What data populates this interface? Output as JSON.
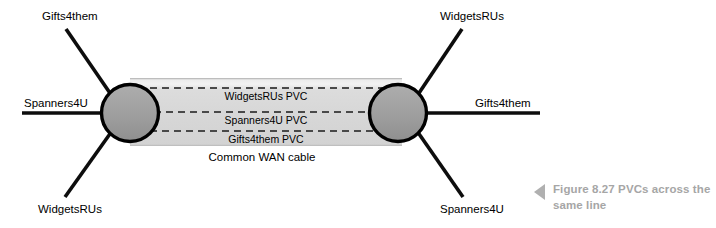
{
  "figure": {
    "caption_marker_icon": "triangle-left-icon",
    "caption": "Figure  8.27 PVCs across the same line",
    "caption_color": "#a6a6a6"
  },
  "diagram": {
    "type": "network-topology",
    "background": "#ffffff",
    "cable": {
      "label": "Common WAN cable",
      "fill_color": "#d7d7d7",
      "highlight_color": "#eeeeee",
      "x_start": 130,
      "x_end": 400,
      "y_top": 78,
      "y_bottom": 146
    },
    "nodes": [
      {
        "name": "left-router",
        "cx": 130,
        "cy": 113,
        "r": 29,
        "fill_color": "#9e9e9e",
        "stroke_color": "#000000"
      },
      {
        "name": "right-router",
        "cx": 398,
        "cy": 113,
        "r": 29,
        "fill_color": "#9e9e9e",
        "stroke_color": "#000000"
      }
    ],
    "pvcs": [
      {
        "label": "WidgetsRUs PVC",
        "y": 88,
        "text_y": 100
      },
      {
        "label": "Spanners4U PVC",
        "y": 112,
        "text_y": 124
      },
      {
        "label": "Gifts4them PVC",
        "y": 131,
        "text_y": 143
      }
    ],
    "endpoint_labels": [
      {
        "name": "left-top-label",
        "text": "Gifts4them",
        "x": 42,
        "y": 20,
        "anchor": "start"
      },
      {
        "name": "left-middle-label",
        "text": "Spanners4U",
        "x": 24,
        "y": 107,
        "anchor": "start"
      },
      {
        "name": "left-bottom-label",
        "text": "WidgetsRUs",
        "x": 38,
        "y": 213,
        "anchor": "start"
      },
      {
        "name": "right-top-label",
        "text": "WidgetsRUs",
        "x": 440,
        "y": 20,
        "anchor": "start"
      },
      {
        "name": "right-middle-label",
        "text": "Gifts4them",
        "x": 475,
        "y": 107,
        "anchor": "start"
      },
      {
        "name": "right-bottom-label",
        "text": "Spanners4U",
        "x": 440,
        "y": 213,
        "anchor": "start"
      }
    ],
    "links": [
      {
        "name": "link-left-top",
        "x1": 66,
        "y1": 29,
        "x2": 112,
        "y2": 96
      },
      {
        "name": "link-left-middle",
        "x1": 22,
        "y1": 113,
        "x2": 104,
        "y2": 113
      },
      {
        "name": "link-left-bottom",
        "x1": 65,
        "y1": 197,
        "x2": 112,
        "y2": 131
      },
      {
        "name": "link-right-top",
        "x1": 462,
        "y1": 29,
        "x2": 417,
        "y2": 96
      },
      {
        "name": "link-right-middle",
        "x1": 424,
        "y1": 113,
        "x2": 540,
        "y2": 113
      },
      {
        "name": "link-right-bottom",
        "x1": 463,
        "y1": 197,
        "x2": 417,
        "y2": 131
      }
    ]
  }
}
